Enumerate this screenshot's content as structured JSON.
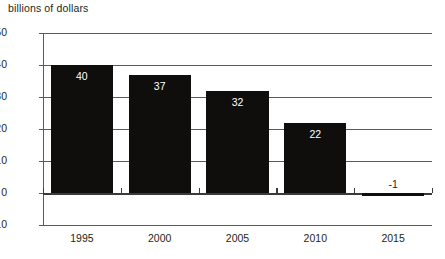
{
  "chart_data": {
    "type": "bar",
    "title": "",
    "ylabel": "billions of dollars",
    "xlabel": "",
    "categories": [
      "1995",
      "2000",
      "2005",
      "2010",
      "2015"
    ],
    "values": [
      40,
      37,
      32,
      22,
      -1
    ],
    "value_labels": [
      "40",
      "37",
      "32",
      "22",
      "-1"
    ],
    "ylim": [
      -10,
      50
    ],
    "ytick_labels": [
      "50",
      "40",
      "30",
      "20",
      "10",
      "0",
      "-10"
    ],
    "ytick_values": [
      50,
      40,
      30,
      20,
      10,
      0,
      -10
    ],
    "grid": true,
    "legend": false,
    "bar_color": "#100d0d",
    "axis_color": "#5a5a5a",
    "label_color": "#231f20",
    "inside_label_color": "#ffffff"
  },
  "axis_title": "billions of dollars"
}
